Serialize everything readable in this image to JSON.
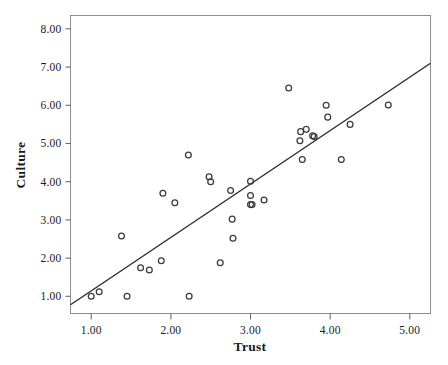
{
  "chart_data": {
    "type": "scatter",
    "title": "",
    "subtitle": "",
    "xlabel": "Trust",
    "ylabel": "Culture",
    "xlim": [
      0.74,
      5.26
    ],
    "ylim": [
      0.55,
      8.35
    ],
    "xticks": [
      1.0,
      2.0,
      3.0,
      4.0,
      5.0
    ],
    "xtick_labels": [
      "1.00",
      "2.00",
      "3.00",
      "4.00",
      "5.00"
    ],
    "yticks": [
      1.0,
      2.0,
      3.0,
      4.0,
      5.0,
      6.0,
      7.0,
      8.0
    ],
    "ytick_labels": [
      "1.00",
      "2.00",
      "3.00",
      "4.00",
      "5.00",
      "6.00",
      "7.00",
      "8.00"
    ],
    "grid": false,
    "legend": false,
    "legend_position": "none",
    "marker": "open-circle",
    "marker_color": "#3a3a3a",
    "line_color": "#2b2b2b",
    "frame_color": "#8e8e8e",
    "series": [
      {
        "name": "observations",
        "x": [
          1.0,
          1.1,
          1.38,
          1.45,
          1.62,
          1.73,
          1.88,
          1.9,
          2.05,
          2.22,
          2.23,
          2.48,
          2.5,
          2.62,
          2.75,
          2.77,
          2.78,
          3.0,
          3.0,
          3.0,
          3.02,
          3.17,
          3.48,
          3.62,
          3.63,
          3.65,
          3.7,
          3.78,
          3.8,
          3.95,
          3.97,
          4.14,
          4.25,
          4.73
        ],
        "y": [
          1.0,
          1.12,
          2.58,
          1.0,
          1.75,
          1.69,
          1.93,
          3.7,
          3.45,
          4.7,
          1.0,
          4.13,
          4.0,
          1.88,
          3.77,
          3.02,
          2.52,
          4.01,
          3.64,
          3.4,
          3.4,
          3.52,
          6.45,
          5.07,
          5.31,
          4.58,
          5.37,
          5.2,
          5.18,
          6.0,
          5.69,
          4.58,
          5.5,
          6.01
        ]
      }
    ],
    "fit_line": {
      "type": "linear",
      "x_start": 0.74,
      "y_start": 0.78,
      "x_end": 5.26,
      "y_end": 7.1
    }
  },
  "axes": {
    "x_title": "Trust",
    "y_title": "Culture"
  }
}
